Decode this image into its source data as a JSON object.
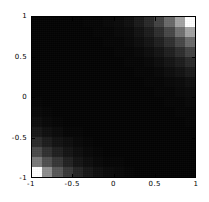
{
  "chart_data": {
    "type": "heatmap",
    "title": "",
    "subtitle": "",
    "xlabel": "",
    "ylabel": "",
    "xlim": [
      -1,
      1
    ],
    "ylim": [
      -1,
      1
    ],
    "xticks": [
      -1,
      -0.5,
      0,
      0.5,
      1
    ],
    "yticks": [
      -1,
      -0.5,
      0,
      0.5,
      1
    ],
    "xtick_labels": [
      "-1",
      "-0.5",
      "0",
      "0.5",
      "1"
    ],
    "ytick_labels": [
      "-1",
      "-0.5",
      "0",
      "0.5",
      "1"
    ],
    "grid": false,
    "legend": false,
    "colormap": "grayscale",
    "color_min": "#000000",
    "color_max": "#ffffff",
    "value_range": [
      0,
      1
    ],
    "nrows": 16,
    "ncols": 16,
    "row_order": "top_to_bottom",
    "row_y_centers": [
      0.9375,
      0.8125,
      0.6875,
      0.5625,
      0.4375,
      0.3125,
      0.1875,
      0.0625,
      -0.0625,
      -0.1875,
      -0.3125,
      -0.4375,
      -0.5625,
      -0.6875,
      -0.8125,
      -0.9375
    ],
    "col_x_centers": [
      -0.9375,
      -0.8125,
      -0.6875,
      -0.5625,
      -0.4375,
      -0.3125,
      -0.1875,
      -0.0625,
      0.0625,
      0.1875,
      0.3125,
      0.4375,
      0.5625,
      0.6875,
      0.8125,
      0.9375
    ],
    "values": [
      [
        0.01,
        0.01,
        0.01,
        0.01,
        0.01,
        0.02,
        0.02,
        0.03,
        0.04,
        0.06,
        0.1,
        0.16,
        0.26,
        0.41,
        0.64,
        1.0
      ],
      [
        0.01,
        0.01,
        0.01,
        0.01,
        0.01,
        0.01,
        0.02,
        0.02,
        0.03,
        0.04,
        0.07,
        0.11,
        0.18,
        0.28,
        0.44,
        0.64
      ],
      [
        0.01,
        0.01,
        0.01,
        0.01,
        0.01,
        0.01,
        0.01,
        0.02,
        0.02,
        0.03,
        0.05,
        0.08,
        0.12,
        0.19,
        0.28,
        0.41
      ],
      [
        0.01,
        0.01,
        0.01,
        0.01,
        0.01,
        0.01,
        0.01,
        0.01,
        0.02,
        0.02,
        0.03,
        0.05,
        0.08,
        0.12,
        0.18,
        0.26
      ],
      [
        0.01,
        0.01,
        0.01,
        0.01,
        0.01,
        0.01,
        0.01,
        0.01,
        0.01,
        0.02,
        0.02,
        0.03,
        0.05,
        0.08,
        0.11,
        0.16
      ],
      [
        0.01,
        0.01,
        0.01,
        0.01,
        0.01,
        0.01,
        0.01,
        0.01,
        0.01,
        0.01,
        0.02,
        0.02,
        0.03,
        0.05,
        0.07,
        0.1
      ],
      [
        0.01,
        0.01,
        0.01,
        0.01,
        0.01,
        0.01,
        0.01,
        0.01,
        0.01,
        0.01,
        0.01,
        0.02,
        0.02,
        0.03,
        0.04,
        0.06
      ],
      [
        0.01,
        0.01,
        0.01,
        0.01,
        0.01,
        0.01,
        0.01,
        0.01,
        0.01,
        0.01,
        0.01,
        0.01,
        0.02,
        0.02,
        0.03,
        0.04
      ],
      [
        0.02,
        0.01,
        0.01,
        0.01,
        0.01,
        0.01,
        0.01,
        0.01,
        0.01,
        0.01,
        0.01,
        0.01,
        0.01,
        0.02,
        0.02,
        0.03
      ],
      [
        0.03,
        0.02,
        0.01,
        0.01,
        0.01,
        0.01,
        0.01,
        0.01,
        0.01,
        0.01,
        0.01,
        0.01,
        0.01,
        0.01,
        0.02,
        0.02
      ],
      [
        0.05,
        0.03,
        0.02,
        0.01,
        0.01,
        0.01,
        0.01,
        0.01,
        0.01,
        0.01,
        0.01,
        0.01,
        0.01,
        0.01,
        0.01,
        0.02
      ],
      [
        0.09,
        0.06,
        0.04,
        0.02,
        0.02,
        0.01,
        0.01,
        0.01,
        0.01,
        0.01,
        0.01,
        0.01,
        0.01,
        0.01,
        0.01,
        0.01
      ],
      [
        0.17,
        0.11,
        0.07,
        0.05,
        0.03,
        0.02,
        0.01,
        0.01,
        0.01,
        0.01,
        0.01,
        0.01,
        0.01,
        0.01,
        0.01,
        0.01
      ],
      [
        0.29,
        0.19,
        0.12,
        0.08,
        0.05,
        0.03,
        0.02,
        0.01,
        0.01,
        0.01,
        0.01,
        0.01,
        0.01,
        0.01,
        0.01,
        0.01
      ],
      [
        0.48,
        0.31,
        0.21,
        0.13,
        0.08,
        0.05,
        0.03,
        0.02,
        0.02,
        0.01,
        0.01,
        0.01,
        0.01,
        0.01,
        0.01,
        0.01
      ],
      [
        1.0,
        0.56,
        0.34,
        0.22,
        0.14,
        0.09,
        0.06,
        0.04,
        0.03,
        0.02,
        0.01,
        0.01,
        0.01,
        0.01,
        0.01,
        0.01
      ]
    ]
  }
}
